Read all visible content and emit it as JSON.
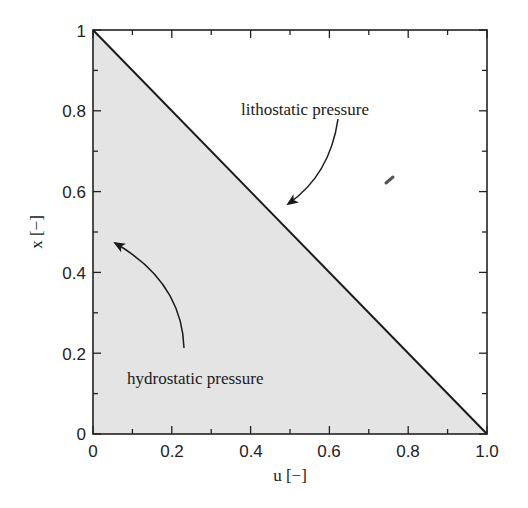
{
  "chart_data": {
    "type": "area",
    "title": "",
    "xlabel": "u [−]",
    "ylabel": "x [−]",
    "xlim": [
      0,
      1.0
    ],
    "ylim": [
      0,
      1
    ],
    "x_ticks": [
      "0",
      "0.2",
      "0.4",
      "0.6",
      "0.8",
      "1.0"
    ],
    "y_ticks": [
      "0",
      "0.2",
      "0.4",
      "0.6",
      "0.8",
      "1"
    ],
    "grid": false,
    "series": [
      {
        "name": "lithostatic pressure",
        "type": "line",
        "x": [
          0,
          1.0
        ],
        "y": [
          1,
          0
        ]
      },
      {
        "name": "hydrostatic pressure",
        "type": "area",
        "x": [
          0,
          0,
          1.0
        ],
        "y": [
          0,
          1,
          0
        ]
      }
    ],
    "annotations": [
      {
        "text": "lithostatic pressure",
        "arrow_to": [
          0.49,
          0.57
        ]
      },
      {
        "text": "hydrostatic pressure",
        "arrow_to": [
          0.06,
          0.47
        ]
      }
    ],
    "colors": {
      "fill": "#e4e4e4",
      "line": "#1a1a1a",
      "axis": "#222222"
    }
  }
}
